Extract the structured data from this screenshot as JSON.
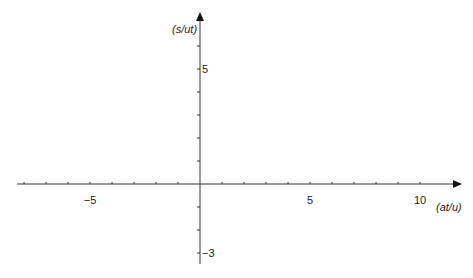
{
  "chart_data": {
    "type": "line",
    "title": "",
    "xlabel": "(at/u)",
    "ylabel": "(s/ut)",
    "xlim": [
      -8.3,
      11.8
    ],
    "ylim": [
      -3.5,
      7.5
    ],
    "grid": false,
    "legend": null,
    "series": [],
    "x_ticks": [
      -8,
      -7,
      -6,
      -5,
      -4,
      -3,
      -2,
      -1,
      1,
      2,
      3,
      4,
      5,
      6,
      7,
      8,
      9,
      10
    ],
    "x_tick_labels": [
      {
        "value": -5,
        "label": "−5"
      },
      {
        "value": 5,
        "label": "5"
      },
      {
        "value": 10,
        "label": "10"
      }
    ],
    "y_ticks": [
      -3,
      -2,
      -1,
      1,
      2,
      3,
      4,
      5,
      6
    ],
    "y_tick_labels": [
      {
        "value": 5,
        "label": "5"
      },
      {
        "value": -3,
        "label": "−3"
      }
    ]
  },
  "layout": {
    "origin_px": [
      200,
      184
    ],
    "x_unit_px": 22,
    "y_unit_px": 23,
    "x_axis_start_px": 17,
    "x_axis_end_px": 462,
    "y_axis_top_px": 12,
    "y_axis_bottom_px": 264,
    "axis_color": "#333333"
  }
}
